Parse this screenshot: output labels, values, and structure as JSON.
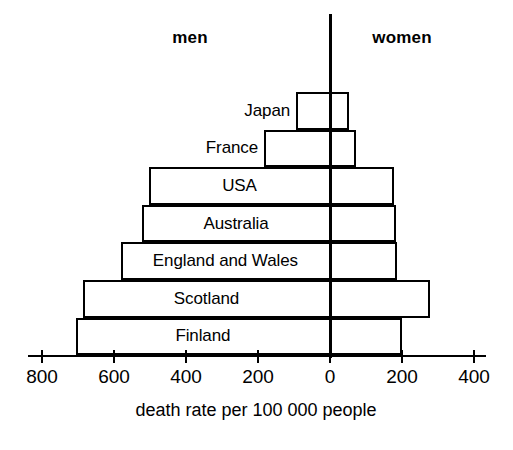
{
  "chart_data": {
    "type": "bar",
    "orientation": "horizontal-diverging",
    "title": "",
    "xlabel": "death rate per 100 000 people",
    "ylabel": "",
    "grid": false,
    "legend_position": "top",
    "legend": [
      "men",
      "women"
    ],
    "axis": {
      "tick_values": [
        800,
        600,
        400,
        200,
        0,
        200,
        400
      ],
      "tick_labels": [
        "800",
        "600",
        "400",
        "200",
        "0",
        "200",
        "400"
      ],
      "left_max": 800,
      "right_max": 400,
      "units_per_200": 200
    },
    "categories": [
      "Japan",
      "France",
      "USA",
      "Australia",
      "England and Wales",
      "Scotland",
      "Finland"
    ],
    "series": [
      {
        "name": "men",
        "values": [
          94,
          183,
          503,
          522,
          581,
          686,
          706
        ]
      },
      {
        "name": "women",
        "values": [
          53,
          72,
          178,
          183,
          186,
          278,
          200
        ]
      }
    ]
  },
  "headers": {
    "men": "men",
    "women": "women"
  },
  "axis_title": "death rate per 100 000 people"
}
